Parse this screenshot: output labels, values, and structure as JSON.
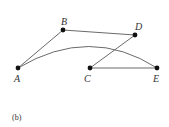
{
  "diagram": {
    "caption": "(b)",
    "nodes": [
      {
        "id": "A",
        "label": "A",
        "x": 18,
        "y": 68,
        "lx": 14,
        "ly": 82
      },
      {
        "id": "B",
        "label": "B",
        "x": 63,
        "y": 30,
        "lx": 61,
        "ly": 25
      },
      {
        "id": "D",
        "label": "D",
        "x": 135,
        "y": 35,
        "lx": 135,
        "ly": 30
      },
      {
        "id": "C",
        "label": "C",
        "x": 90,
        "y": 68,
        "lx": 84,
        "ly": 82
      },
      {
        "id": "E",
        "label": "E",
        "x": 157,
        "y": 68,
        "lx": 153,
        "ly": 82
      }
    ],
    "edges": [
      {
        "from": "A",
        "to": "B",
        "type": "straight"
      },
      {
        "from": "B",
        "to": "D",
        "type": "straight"
      },
      {
        "from": "D",
        "to": "C",
        "type": "straight"
      },
      {
        "from": "C",
        "to": "E",
        "type": "straight"
      },
      {
        "from": "A",
        "to": "E",
        "type": "curved"
      }
    ],
    "colors": {
      "edge": "#6a6a6a",
      "node": "#111111",
      "label": "#333333"
    }
  }
}
